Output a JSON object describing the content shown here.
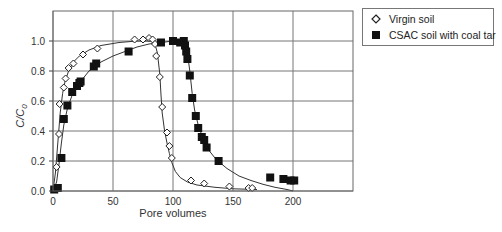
{
  "chart_data": {
    "type": "scatter",
    "title": "",
    "xlabel": "Pore volumes",
    "ylabel": "C/C0",
    "ylabel_main": "C/C",
    "ylabel_sub": "0",
    "xlim": [
      0,
      250
    ],
    "ylim": [
      0,
      1.2
    ],
    "xticks": [
      0,
      50,
      100,
      150,
      200
    ],
    "yticks": [
      0.0,
      0.2,
      0.4,
      0.6,
      0.8,
      1.0
    ],
    "xtick_labels": [
      "0",
      "50",
      "100",
      "150",
      "200"
    ],
    "ytick_labels": [
      "0.0",
      "0.2",
      "0.4",
      "0.6",
      "0.8",
      "1.0"
    ],
    "grid": true,
    "legend_position": "upper right (outside plot)",
    "series": [
      {
        "name": "Virgin soil",
        "marker": "open-diamond",
        "color": "#222222",
        "points": [
          [
            1.5,
            0.01
          ],
          [
            3,
            0.16
          ],
          [
            5,
            0.38
          ],
          [
            5.5,
            0.58
          ],
          [
            9,
            0.69
          ],
          [
            10.5,
            0.75
          ],
          [
            13,
            0.82
          ],
          [
            17,
            0.85
          ],
          [
            25,
            0.91
          ],
          [
            37,
            0.95
          ],
          [
            68,
            1.01
          ],
          [
            75,
            1.01
          ],
          [
            80,
            1.02
          ],
          [
            83,
            1.01
          ],
          [
            85,
            0.98
          ],
          [
            86,
            0.9
          ],
          [
            89,
            0.76
          ],
          [
            91,
            0.56
          ],
          [
            95,
            0.39
          ],
          [
            97,
            0.3
          ],
          [
            99,
            0.22
          ],
          [
            115,
            0.07
          ],
          [
            126,
            0.05
          ],
          [
            147,
            0.03
          ],
          [
            163,
            0.02
          ],
          [
            166,
            0.02
          ]
        ],
        "fit_curve": [
          [
            0,
            0.0
          ],
          [
            2,
            0.12
          ],
          [
            4,
            0.32
          ],
          [
            6,
            0.52
          ],
          [
            8,
            0.65
          ],
          [
            10,
            0.73
          ],
          [
            13,
            0.8
          ],
          [
            17,
            0.86
          ],
          [
            22,
            0.9
          ],
          [
            30,
            0.94
          ],
          [
            40,
            0.97
          ],
          [
            55,
            0.99
          ],
          [
            70,
            1.0
          ],
          [
            82,
            1.0
          ],
          [
            85,
            0.98
          ],
          [
            87,
            0.92
          ],
          [
            89,
            0.78
          ],
          [
            90,
            0.64
          ],
          [
            91,
            0.52
          ],
          [
            93,
            0.4
          ],
          [
            95,
            0.32
          ],
          [
            97,
            0.25
          ],
          [
            99,
            0.19
          ],
          [
            102,
            0.13
          ],
          [
            106,
            0.09
          ],
          [
            112,
            0.06
          ],
          [
            120,
            0.04
          ],
          [
            135,
            0.025
          ],
          [
            150,
            0.015
          ],
          [
            170,
            0.01
          ]
        ]
      },
      {
        "name": "CSAC soil with coal tar",
        "marker": "filled-square",
        "color": "#111111",
        "points": [
          [
            1,
            0.01
          ],
          [
            4,
            0.02
          ],
          [
            7,
            0.22
          ],
          [
            9,
            0.48
          ],
          [
            12,
            0.57
          ],
          [
            16,
            0.66
          ],
          [
            20,
            0.7
          ],
          [
            22,
            0.72
          ],
          [
            23,
            0.73
          ],
          [
            34,
            0.83
          ],
          [
            36,
            0.85
          ],
          [
            63,
            0.93
          ],
          [
            90,
            0.99
          ],
          [
            100,
            1.0
          ],
          [
            106,
            0.99
          ],
          [
            109,
            1.0
          ],
          [
            110,
            0.97
          ],
          [
            111,
            0.93
          ],
          [
            112,
            0.88
          ],
          [
            114,
            0.77
          ],
          [
            116,
            0.62
          ],
          [
            119,
            0.5
          ],
          [
            121,
            0.42
          ],
          [
            124,
            0.36
          ],
          [
            126,
            0.34
          ],
          [
            128,
            0.29
          ],
          [
            138,
            0.2
          ],
          [
            181,
            0.09
          ],
          [
            192,
            0.08
          ],
          [
            198,
            0.07
          ],
          [
            201,
            0.07
          ]
        ],
        "fit_curve": [
          [
            0,
            0.0
          ],
          [
            3,
            0.06
          ],
          [
            5,
            0.18
          ],
          [
            7,
            0.32
          ],
          [
            9,
            0.44
          ],
          [
            12,
            0.55
          ],
          [
            16,
            0.64
          ],
          [
            20,
            0.7
          ],
          [
            25,
            0.75
          ],
          [
            30,
            0.8
          ],
          [
            40,
            0.86
          ],
          [
            50,
            0.9
          ],
          [
            60,
            0.93
          ],
          [
            70,
            0.96
          ],
          [
            80,
            0.98
          ],
          [
            90,
            0.99
          ],
          [
            100,
            1.0
          ],
          [
            108,
            1.0
          ],
          [
            110,
            0.98
          ],
          [
            112,
            0.92
          ],
          [
            114,
            0.8
          ],
          [
            116,
            0.65
          ],
          [
            118,
            0.54
          ],
          [
            121,
            0.44
          ],
          [
            125,
            0.35
          ],
          [
            130,
            0.27
          ],
          [
            136,
            0.21
          ],
          [
            145,
            0.15
          ],
          [
            155,
            0.1
          ],
          [
            165,
            0.07
          ],
          [
            175,
            0.045
          ],
          [
            185,
            0.025
          ],
          [
            195,
            0.01
          ],
          [
            200,
            0.0
          ]
        ]
      }
    ]
  },
  "legend": {
    "items": [
      {
        "label": "Virgin soil",
        "symbol": "open-diamond"
      },
      {
        "label": "CSAC soil with coal tar",
        "symbol": "filled-square"
      }
    ]
  }
}
